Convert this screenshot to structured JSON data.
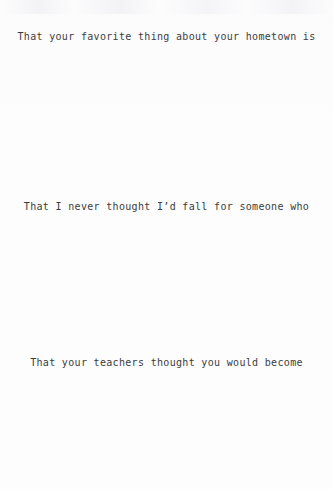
{
  "document": {
    "kind": "scanned-typewritten-page",
    "background_color": "#fdfdfd",
    "text_color": "#3c3c3e",
    "lines": [
      {
        "id": "line-1",
        "text": "That your favorite thing about your hometown is"
      },
      {
        "id": "line-2",
        "text": "That I never thought I’d fall for someone who"
      },
      {
        "id": "line-3",
        "text": "That your teachers thought you would become"
      }
    ]
  }
}
